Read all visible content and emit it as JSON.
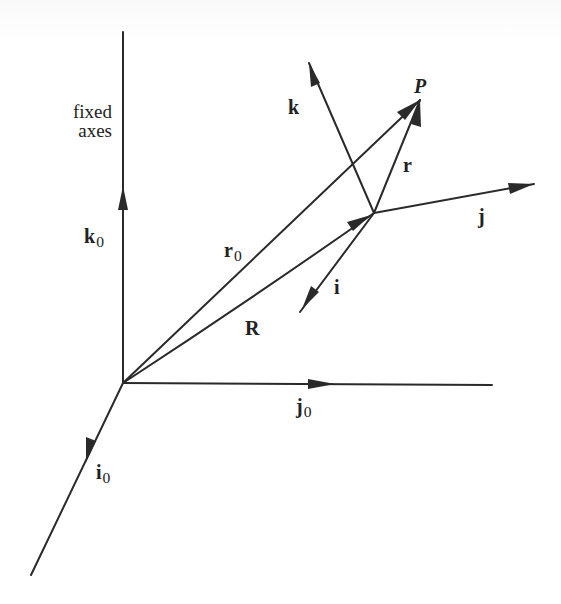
{
  "figure": {
    "caption_lines": [
      "fixed",
      "axes"
    ],
    "fixed_frame": {
      "origin": [
        123,
        383
      ],
      "axes": [
        {
          "name": "k0",
          "symbol": "k",
          "subscript": "0",
          "from": [
            123,
            383
          ],
          "to": [
            123,
            32
          ],
          "arrow_at": [
            123,
            191
          ],
          "label_pos": [
            84,
            226
          ]
        },
        {
          "name": "j0",
          "symbol": "j",
          "subscript": "0",
          "from": [
            123,
            383
          ],
          "to": [
            492,
            385
          ],
          "arrow_at": [
            332,
            384
          ],
          "label_pos": [
            296,
            394
          ]
        },
        {
          "name": "i0",
          "symbol": "i",
          "subscript": "0",
          "from": [
            123,
            383
          ],
          "to": [
            31,
            575
          ],
          "arrow_at": [
            90,
            452
          ],
          "label_pos": [
            96,
            460
          ]
        }
      ]
    },
    "moving_frame": {
      "origin": [
        374,
        213
      ],
      "axes": [
        {
          "name": "k",
          "symbol": "k",
          "from": [
            374,
            213
          ],
          "to": [
            309,
            63
          ],
          "label_pos": [
            288,
            97
          ]
        },
        {
          "name": "j",
          "symbol": "j",
          "from": [
            374,
            213
          ],
          "to": [
            534,
            184
          ],
          "label_pos": [
            477,
            205
          ]
        },
        {
          "name": "i",
          "symbol": "i",
          "from": [
            374,
            213
          ],
          "to": [
            300,
            312
          ],
          "label_pos": [
            333,
            276
          ]
        }
      ]
    },
    "point": {
      "name": "P",
      "label": "P",
      "pos": [
        420,
        100
      ],
      "label_pos": [
        414,
        74
      ]
    },
    "vectors": [
      {
        "name": "r0",
        "symbol": "r",
        "subscript": "0",
        "from": [
          123,
          383
        ],
        "to": [
          420,
          100
        ],
        "label_pos": [
          225,
          238
        ]
      },
      {
        "name": "R",
        "symbol": "R",
        "from": [
          123,
          383
        ],
        "to": [
          374,
          213
        ],
        "label_pos": [
          245,
          317
        ]
      },
      {
        "name": "r",
        "symbol": "r",
        "from": [
          374,
          213
        ],
        "to": [
          420,
          100
        ],
        "label_pos": [
          402,
          155
        ]
      }
    ],
    "line_color": "#2a2a2a",
    "background": "#ffffff"
  }
}
